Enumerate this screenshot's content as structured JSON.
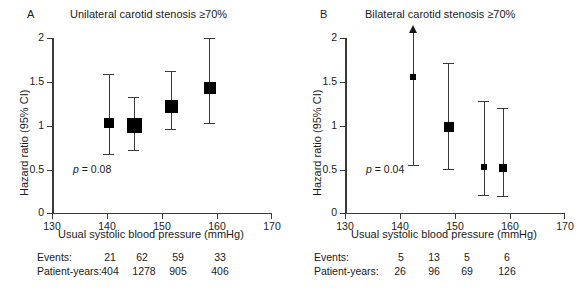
{
  "figure": {
    "panels": [
      {
        "letter": "A",
        "title": "Unilateral carotid stenosis ≥70%",
        "pvalue": "p = 0.08",
        "axes": {
          "ylabel": "Hazard ratio (95% CI)",
          "xlabel": "Usual systolic blood pressure (mmHg)",
          "yticks": [
            "0",
            "0.5",
            "1",
            "1.5",
            "2"
          ],
          "xticks": [
            "130",
            "140",
            "150",
            "160",
            "170"
          ],
          "xlim": [
            130,
            170
          ],
          "ylim": [
            0,
            2
          ]
        },
        "counts": {
          "row1_label": "Events:",
          "row2_label": "Patient-years:",
          "events": [
            "21",
            "62",
            "59",
            "33"
          ],
          "patient_years": [
            "404",
            "1278",
            "905",
            "406"
          ]
        }
      },
      {
        "letter": "B",
        "title": "Bilateral carotid stenosis ≥70%",
        "pvalue": "p = 0.04",
        "axes": {
          "ylabel": "Hazard ratio (95% CI)",
          "xlabel": "Usual systolic blood pressure (mmHg)",
          "yticks": [
            "0",
            "0.5",
            "1",
            "1.5",
            "2"
          ],
          "xticks": [
            "130",
            "140",
            "150",
            "160",
            "170"
          ],
          "xlim": [
            130,
            170
          ],
          "ylim": [
            0,
            2
          ]
        },
        "counts": {
          "row1_label": "Events:",
          "row2_label": "Patient-years:",
          "events": [
            "5",
            "13",
            "5",
            "6"
          ],
          "patient_years": [
            "26",
            "96",
            "69",
            "126"
          ]
        }
      }
    ]
  },
  "chart_data": [
    {
      "type": "scatter",
      "title": "Unilateral carotid stenosis ≥70%",
      "panel": "A",
      "xlabel": "Usual systolic blood pressure (mmHg)",
      "ylabel": "Hazard ratio (95% CI)",
      "xlim": [
        130,
        170
      ],
      "ylim": [
        0,
        2
      ],
      "xticks": [
        130,
        140,
        150,
        160,
        170
      ],
      "yticks": [
        0,
        0.5,
        1,
        1.5,
        2
      ],
      "grid": false,
      "legend": null,
      "annotations": [
        "p = 0.08"
      ],
      "x": [
        138.8,
        144.6,
        151.3,
        158.3
      ],
      "y": [
        1.03,
        1.0,
        1.24,
        1.45
      ],
      "ci_low": [
        0.67,
        0.77,
        0.95,
        1.02
      ],
      "ci_high": [
        1.58,
        1.32,
        1.61,
        2.0
      ],
      "ci_high_censored": [
        false,
        false,
        false,
        false
      ],
      "marker_size_px": [
        10,
        15,
        13,
        12
      ],
      "events": [
        21,
        62,
        59,
        33
      ],
      "patient_years": [
        404,
        1278,
        905,
        406
      ]
    },
    {
      "type": "scatter",
      "title": "Bilateral carotid stenosis ≥70%",
      "panel": "B",
      "xlabel": "Usual systolic blood pressure (mmHg)",
      "ylabel": "Hazard ratio (95% CI)",
      "xlim": [
        130,
        170
      ],
      "ylim": [
        0,
        2
      ],
      "xticks": [
        130,
        140,
        150,
        160,
        170
      ],
      "yticks": [
        0,
        0.5,
        1,
        1.5,
        2
      ],
      "grid": false,
      "legend": null,
      "annotations": [
        "p = 0.04"
      ],
      "x": [
        140.7,
        147.0,
        153.4,
        156.8
      ],
      "y": [
        1.56,
        0.99,
        0.52,
        0.49
      ],
      "ci_low": [
        0.63,
        0.58,
        0.19,
        0.18
      ],
      "ci_high": [
        2.15,
        1.72,
        1.27,
        1.19
      ],
      "ci_high_censored": [
        true,
        false,
        false,
        false
      ],
      "marker_size_px": [
        6,
        10,
        6,
        8
      ],
      "events": [
        5,
        13,
        5,
        6
      ],
      "patient_years": [
        26,
        96,
        69,
        126
      ]
    }
  ]
}
